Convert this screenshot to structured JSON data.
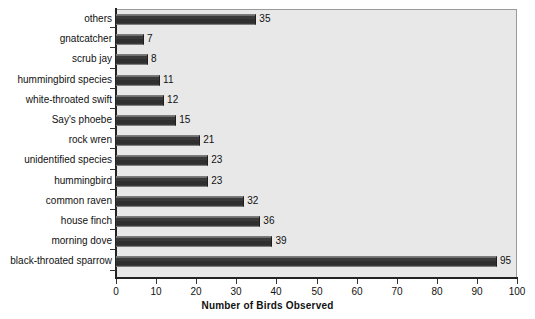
{
  "chart_data": {
    "type": "bar",
    "orientation": "horizontal",
    "title": "",
    "subtitle": "",
    "xlabel": "Number of Birds Observed",
    "ylabel": "",
    "xlim": [
      0,
      100
    ],
    "xticks": [
      0,
      10,
      20,
      30,
      40,
      50,
      60,
      70,
      80,
      90,
      100
    ],
    "xtick_labels": [
      "0",
      "10",
      "20",
      "30",
      "40",
      "50",
      "60",
      "70",
      "80",
      "90",
      "100"
    ],
    "grid": false,
    "legend": null,
    "data_labels": true,
    "categories": [
      "others",
      "gnatcatcher",
      "scrub jay",
      "hummingbird species",
      "white-throated swift",
      "Say's phoebe",
      "rock wren",
      "unidentified species",
      "hummingbird",
      "common raven",
      "house finch",
      "morning dove",
      "black-throated sparrow"
    ],
    "values": [
      35,
      7,
      8,
      11,
      12,
      15,
      21,
      23,
      23,
      32,
      36,
      39,
      95
    ],
    "value_labels": [
      "35",
      "7",
      "8",
      "11",
      "12",
      "15",
      "21",
      "23",
      "23",
      "32",
      "36",
      "39",
      "95"
    ],
    "colors": {
      "bar_fill": "#3a3a3a",
      "bar_edge": "#1d1d1d",
      "bar_highlight": "#6f6f6f",
      "plot_background": "#e8e8e8",
      "figure_background": "#ffffff",
      "axis": "#222222",
      "text": "#111111"
    }
  }
}
